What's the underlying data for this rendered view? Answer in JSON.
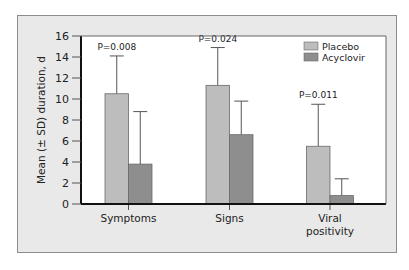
{
  "chart_data": {
    "type": "bar",
    "title": "",
    "xlabel": "",
    "ylabel": "Mean (± SD) duration, d",
    "ylim": [
      0,
      16
    ],
    "yticks": [
      0,
      2,
      4,
      6,
      8,
      10,
      12,
      14,
      16
    ],
    "grid": false,
    "legend_position": "top-right",
    "categories": [
      "Symptoms",
      "Signs",
      "Viral positivity"
    ],
    "category_lines": [
      [
        "Symptoms"
      ],
      [
        "Signs"
      ],
      [
        "Viral",
        "positivity"
      ]
    ],
    "series": [
      {
        "name": "Placebo",
        "color": "#bdbdbd",
        "values": [
          10.5,
          11.3,
          5.5
        ],
        "sd_upper": [
          14.1,
          14.9,
          9.5
        ]
      },
      {
        "name": "Acyclovir",
        "color": "#8e8e8e",
        "values": [
          3.8,
          6.6,
          0.8
        ],
        "sd_upper": [
          8.8,
          9.8,
          2.4
        ]
      }
    ],
    "annotations": [
      "P=0.008",
      "P=0.024",
      "P=0.011"
    ]
  }
}
